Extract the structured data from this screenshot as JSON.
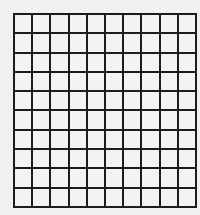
{
  "grid": {
    "rows": 10,
    "columns": 10,
    "line_color": "#1c1c1c",
    "cell_color": "#f3f3f3",
    "background": "#f1f1f1"
  }
}
